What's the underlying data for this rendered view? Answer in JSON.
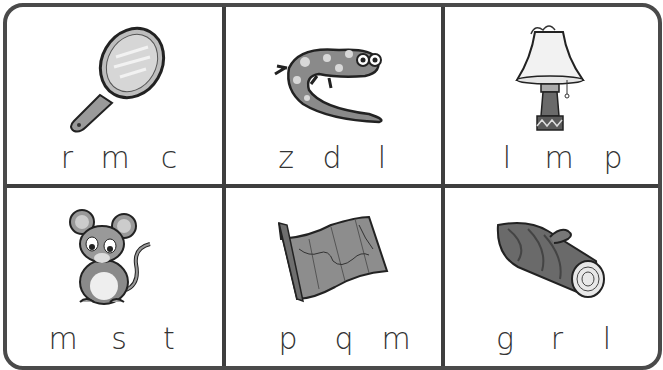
{
  "worksheet": {
    "cells": [
      {
        "picture": "mirror",
        "letters": [
          "r",
          "m",
          "c"
        ]
      },
      {
        "picture": "salamander",
        "letters": [
          "z",
          "d",
          "l"
        ]
      },
      {
        "picture": "lamp",
        "letters": [
          "l",
          "m",
          "p"
        ]
      },
      {
        "picture": "mouse",
        "letters": [
          "m",
          "s",
          "t"
        ]
      },
      {
        "picture": "map",
        "letters": [
          "p",
          "q",
          "m"
        ]
      },
      {
        "picture": "log",
        "letters": [
          "g",
          "r",
          "l"
        ]
      }
    ]
  },
  "colors": {
    "border": "#4a4a4a",
    "ink": "#333333",
    "fill": "#8a8a8a"
  }
}
